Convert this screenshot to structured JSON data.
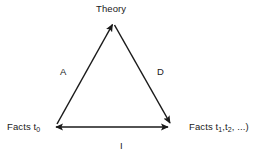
{
  "diagram": {
    "title_text": "Theory Facts Triangle",
    "background_color": "#ffffff",
    "stroke_color": "#1a1a1a",
    "text_color": "#1a1a1a",
    "nodes": [
      {
        "id": "theory",
        "label": "Theory",
        "x": 113,
        "y": 22
      },
      {
        "id": "facts-t0",
        "label_main": "Facts t",
        "label_sub": "0",
        "x": 51,
        "y": 127
      },
      {
        "id": "facts-tn",
        "label_main": "Facts t",
        "label_sub": "1",
        "label_rest": ",t",
        "label_sub2": "2",
        "label_tail": ", ...)",
        "x": 172,
        "y": 127
      }
    ],
    "edges": [
      {
        "id": "edge-a",
        "label": "A",
        "from": "facts-t0",
        "to": "theory",
        "arrow": "to"
      },
      {
        "id": "edge-d",
        "label": "D",
        "from": "theory",
        "to": "facts-tn",
        "arrow": "to"
      },
      {
        "id": "edge-i",
        "label": "I",
        "from": "facts-t0",
        "to": "facts-tn",
        "arrow": "both"
      }
    ]
  }
}
